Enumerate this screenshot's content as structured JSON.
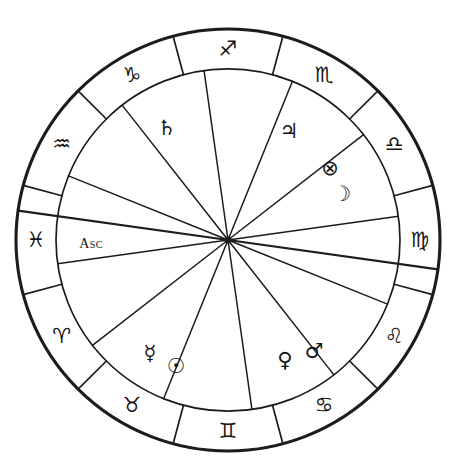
{
  "chart": {
    "type": "zodiac-wheel",
    "center": {
      "x": 228,
      "y": 240
    },
    "radii": {
      "outer": 212,
      "inner": 172,
      "sign_glyph": 192,
      "planet_glyph": 118
    },
    "ink_color": "#1c1c1c",
    "background_color": "#ffffff"
  },
  "signs": [
    {
      "name": "sagittarius",
      "glyph": "♐",
      "label": "Sagittarius",
      "angle": -90,
      "glyph_size": 21
    },
    {
      "name": "capricorn",
      "glyph": "♑",
      "label": "Capricorn",
      "angle": -120,
      "glyph_size": 21
    },
    {
      "name": "aquarius",
      "glyph": "♒",
      "label": "Aquarius",
      "angle": -150,
      "glyph_size": 20
    },
    {
      "name": "pisces",
      "glyph": "♓",
      "label": "Pisces",
      "angle": 180,
      "glyph_size": 20
    },
    {
      "name": "aries",
      "glyph": "♈",
      "label": "Aries",
      "angle": 150,
      "glyph_size": 21
    },
    {
      "name": "taurus",
      "glyph": "♉",
      "label": "Taurus",
      "angle": 120,
      "glyph_size": 21
    },
    {
      "name": "gemini",
      "glyph": "♊",
      "label": "Gemini",
      "angle": 90,
      "glyph_size": 20
    },
    {
      "name": "cancer",
      "glyph": "♋",
      "label": "Cancer",
      "angle": 60,
      "glyph_size": 20
    },
    {
      "name": "leo",
      "glyph": "♌",
      "label": "Leo",
      "angle": 30,
      "glyph_size": 21
    },
    {
      "name": "virgo",
      "glyph": "♍",
      "label": "Virgo",
      "angle": 0,
      "glyph_size": 20
    },
    {
      "name": "libra",
      "glyph": "♎",
      "label": "Libra",
      "angle": -30,
      "glyph_size": 20
    },
    {
      "name": "scorpio",
      "glyph": "♏",
      "label": "Scorpio",
      "angle": -60,
      "glyph_size": 21
    }
  ],
  "sign_boundaries_deg": [
    -105,
    -75,
    -45,
    -15,
    15,
    45,
    75,
    105,
    135,
    165,
    -165,
    -135
  ],
  "house_spokes_deg": [
    -98,
    -68,
    -38,
    -8,
    22,
    52,
    82,
    112,
    142,
    172,
    -158,
    -128
  ],
  "horizon_axis": {
    "name": "ascendant-descendant-axis",
    "angle_deg": 188,
    "label": "Asc"
  },
  "placements": [
    {
      "name": "saturn",
      "glyph": "♄",
      "label": "Saturn",
      "x": 167,
      "y": 128,
      "glyph_size": 22
    },
    {
      "name": "jupiter",
      "glyph": "♃",
      "label": "Jupiter",
      "x": 289,
      "y": 131,
      "glyph_size": 22
    },
    {
      "name": "part-of-fortune",
      "glyph": "⊗",
      "label": "Part of Fortune",
      "x": 330,
      "y": 168,
      "glyph_size": 19
    },
    {
      "name": "moon",
      "glyph": "☽",
      "label": "Moon",
      "x": 342,
      "y": 194,
      "glyph_size": 21
    },
    {
      "name": "mercury",
      "glyph": "☿",
      "label": "Mercury",
      "x": 150,
      "y": 353,
      "glyph_size": 21
    },
    {
      "name": "sun",
      "glyph": "☉",
      "label": "Sun",
      "x": 176,
      "y": 366,
      "glyph_size": 20
    },
    {
      "name": "venus",
      "glyph": "♀",
      "label": "Venus",
      "x": 285,
      "y": 360,
      "glyph_size": 21
    },
    {
      "name": "mars",
      "glyph": "♂",
      "label": "Mars",
      "x": 314,
      "y": 351,
      "glyph_size": 22
    }
  ],
  "labels": {
    "ascendant": {
      "name": "ascendant-label",
      "text": "Asc",
      "x": 91,
      "y": 243
    }
  }
}
